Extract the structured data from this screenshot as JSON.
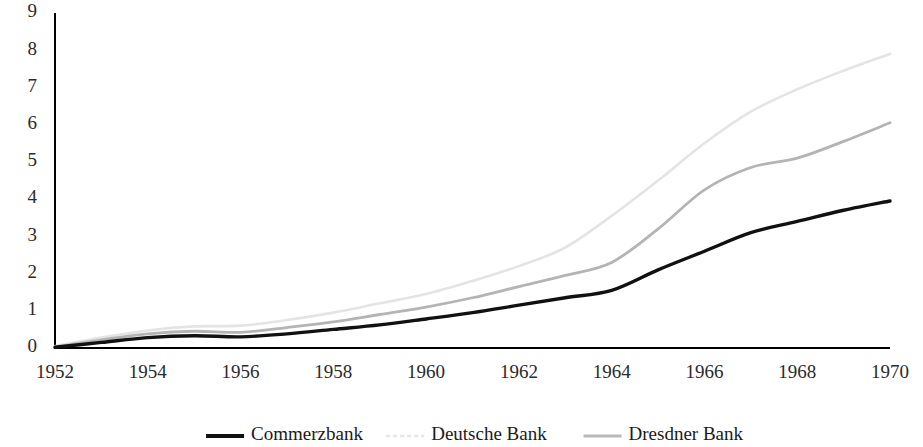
{
  "chart_data": {
    "type": "line",
    "title": "",
    "subtitle": "",
    "xlabel": "",
    "ylabel": "",
    "xlim": [
      1952,
      1970
    ],
    "ylim": [
      0,
      9
    ],
    "grid": false,
    "legend_position": "bottom",
    "x": [
      1952,
      1953,
      1954,
      1955,
      1956,
      1957,
      1958,
      1959,
      1960,
      1961,
      1962,
      1963,
      1964,
      1965,
      1966,
      1967,
      1968,
      1969,
      1970
    ],
    "x_tick_labels": [
      "1952",
      "1954",
      "1956",
      "1958",
      "1960",
      "1962",
      "1964",
      "1966",
      "1968",
      "1970"
    ],
    "x_ticks": [
      1952,
      1954,
      1956,
      1958,
      1960,
      1962,
      1964,
      1966,
      1968,
      1970
    ],
    "y_tick_labels": [
      "0",
      "1",
      "2",
      "3",
      "4",
      "5",
      "6",
      "7",
      "8",
      "9"
    ],
    "y_ticks": [
      0,
      1,
      2,
      3,
      4,
      5,
      6,
      7,
      8,
      9
    ],
    "series": [
      {
        "name": "Commerzbank",
        "color": "#111111",
        "width": 3.4,
        "dash": "none",
        "values": [
          0.02,
          0.15,
          0.28,
          0.33,
          0.3,
          0.38,
          0.5,
          0.62,
          0.78,
          0.95,
          1.15,
          1.35,
          1.55,
          2.1,
          2.6,
          3.1,
          3.4,
          3.7,
          3.95
        ]
      },
      {
        "name": "Deutsche Bank",
        "color": "#e4e4e4",
        "width": 2.6,
        "dash": "none",
        "values": [
          0.05,
          0.28,
          0.47,
          0.58,
          0.6,
          0.75,
          0.95,
          1.2,
          1.45,
          1.8,
          2.2,
          2.7,
          3.55,
          4.5,
          5.5,
          6.35,
          6.95,
          7.45,
          7.9
        ]
      },
      {
        "name": "Dresdner Bank",
        "color": "#b4b4b4",
        "width": 2.8,
        "dash": "none",
        "values": [
          0.03,
          0.22,
          0.38,
          0.45,
          0.42,
          0.55,
          0.7,
          0.9,
          1.1,
          1.35,
          1.65,
          1.95,
          2.3,
          3.2,
          4.25,
          4.85,
          5.1,
          5.55,
          6.05
        ]
      }
    ]
  },
  "legend": {
    "items": [
      {
        "label": "Commerzbank",
        "color": "#111111",
        "width": 4.2,
        "dash": "none"
      },
      {
        "label": "Deutsche Bank",
        "color": "#e6e6e6",
        "width": 2.6,
        "dash": "4 3"
      },
      {
        "label": "Dresdner Bank",
        "color": "#b9b9b9",
        "width": 2.8,
        "dash": "none"
      }
    ]
  },
  "axes": {
    "axis_color": "#000000"
  }
}
